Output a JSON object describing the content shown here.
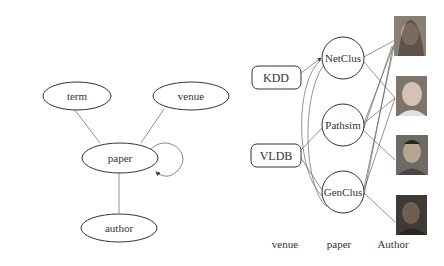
{
  "left_graph": {
    "nodes": {
      "term": "term",
      "venue": "venue",
      "paper": "paper",
      "author": "author"
    }
  },
  "right_graph": {
    "venues": [
      "KDD",
      "VLDB"
    ],
    "papers": [
      "NetClus",
      "Pathsim",
      "GenClus"
    ],
    "authors": [
      "author-photo-1",
      "author-photo-2",
      "author-photo-3",
      "author-photo-4"
    ],
    "column_labels": {
      "venue": "venue",
      "paper": "paper",
      "author": "Author"
    }
  }
}
